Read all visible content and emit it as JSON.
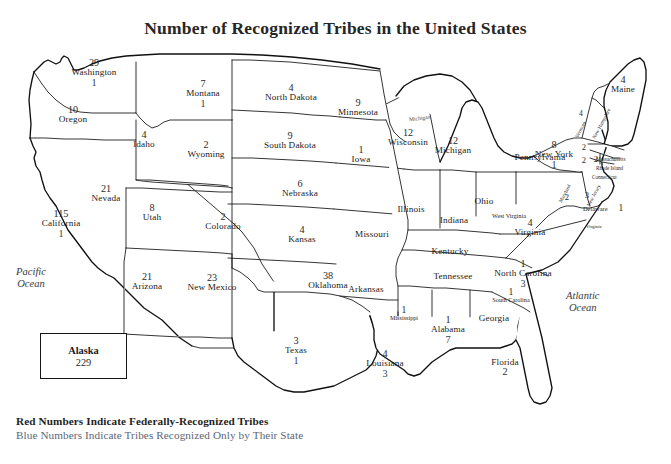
{
  "title": "Number of Recognized Tribes in the United States",
  "legend": {
    "federal": "Red Numbers Indicate Federally-Recognized Tribes",
    "state": "Blue Numbers Indicate Tribes Recognized Only by Their State"
  },
  "inset": {
    "name": "Alaska",
    "federal": "229"
  },
  "oceans": [
    {
      "name": "pacific",
      "line1": "Pacific",
      "line2": "Ocean"
    },
    {
      "name": "atlantic",
      "line1": "Atlantic",
      "line2": "Ocean"
    }
  ],
  "lakes": [
    {
      "name": "lake-michigan",
      "label": "Michigan"
    }
  ],
  "states": [
    {
      "key": "washington",
      "name": "Washington",
      "federal": "29",
      "state_only": "1"
    },
    {
      "key": "oregon",
      "name": "Oregon",
      "federal": "10",
      "state_only": ""
    },
    {
      "key": "idaho",
      "name": "Idaho",
      "federal": "4",
      "state_only": ""
    },
    {
      "key": "montana",
      "name": "Montana",
      "federal": "7",
      "state_only": "1"
    },
    {
      "key": "wyoming",
      "name": "Wyoming",
      "federal": "2",
      "state_only": ""
    },
    {
      "key": "nevada",
      "name": "Nevada",
      "federal": "21",
      "state_only": ""
    },
    {
      "key": "california",
      "name": "California",
      "federal": "115",
      "state_only": "1"
    },
    {
      "key": "utah",
      "name": "Utah",
      "federal": "8",
      "state_only": ""
    },
    {
      "key": "arizona",
      "name": "Arizona",
      "federal": "21",
      "state_only": ""
    },
    {
      "key": "colorado",
      "name": "Colorado",
      "federal": "2",
      "state_only": ""
    },
    {
      "key": "new-mexico",
      "name": "New Mexico",
      "federal": "23",
      "state_only": ""
    },
    {
      "key": "north-dakota",
      "name": "North Dakota",
      "federal": "4",
      "state_only": ""
    },
    {
      "key": "south-dakota",
      "name": "South Dakota",
      "federal": "9",
      "state_only": ""
    },
    {
      "key": "nebraska",
      "name": "Nebraska",
      "federal": "6",
      "state_only": ""
    },
    {
      "key": "kansas",
      "name": "Kansas",
      "federal": "4",
      "state_only": ""
    },
    {
      "key": "oklahoma",
      "name": "Oklahoma",
      "federal": "38",
      "state_only": ""
    },
    {
      "key": "texas",
      "name": "Texas",
      "federal": "3",
      "state_only": "1"
    },
    {
      "key": "minnesota",
      "name": "Minnesota",
      "federal": "9",
      "state_only": ""
    },
    {
      "key": "iowa",
      "name": "Iowa",
      "federal": "1",
      "state_only": ""
    },
    {
      "key": "missouri",
      "name": "Missouri",
      "federal": "",
      "state_only": ""
    },
    {
      "key": "arkansas",
      "name": "Arkansas",
      "federal": "",
      "state_only": ""
    },
    {
      "key": "louisiana",
      "name": "Louisiana",
      "federal": "4",
      "state_only": "3"
    },
    {
      "key": "wisconsin",
      "name": "Wisconsin",
      "federal": "12",
      "state_only": ""
    },
    {
      "key": "illinois",
      "name": "Illinois",
      "federal": "",
      "state_only": ""
    },
    {
      "key": "michigan",
      "name": "Michigan",
      "federal": "12",
      "state_only": ""
    },
    {
      "key": "indiana",
      "name": "Indiana",
      "federal": "",
      "state_only": ""
    },
    {
      "key": "ohio",
      "name": "Ohio",
      "federal": "",
      "state_only": ""
    },
    {
      "key": "kentucky",
      "name": "Kentucky",
      "federal": "",
      "state_only": ""
    },
    {
      "key": "tennessee",
      "name": "Tennessee",
      "federal": "",
      "state_only": ""
    },
    {
      "key": "mississippi",
      "name": "Mississippi",
      "federal": "1",
      "state_only": ""
    },
    {
      "key": "alabama",
      "name": "Alabama",
      "federal": "1",
      "state_only": "7"
    },
    {
      "key": "georgia",
      "name": "Georgia",
      "federal": "",
      "state_only": ""
    },
    {
      "key": "florida",
      "name": "Florida",
      "federal": "2",
      "state_only": ""
    },
    {
      "key": "south-carolina",
      "name": "South Carolina",
      "federal": "1",
      "state_only": ""
    },
    {
      "key": "north-carolina",
      "name": "North Carolina",
      "federal": "1",
      "state_only": "3"
    },
    {
      "key": "virginia",
      "name": "Virginia",
      "federal": "4",
      "state_only": ""
    },
    {
      "key": "west-virginia",
      "name": "West Virginia",
      "federal": "",
      "state_only": ""
    },
    {
      "key": "pennsylvania",
      "name": "Pennsylvania",
      "federal": "",
      "state_only": ""
    },
    {
      "key": "new-york",
      "name": "New York",
      "federal": "8",
      "state_only": "1"
    },
    {
      "key": "maine",
      "name": "Maine",
      "federal": "4",
      "state_only": ""
    },
    {
      "key": "vermont",
      "name": "Vermont",
      "federal": "4",
      "state_only": ""
    },
    {
      "key": "new-hampshire",
      "name": "New Hampshire",
      "federal": "",
      "state_only": ""
    },
    {
      "key": "massachusetts",
      "name": "Massachusetts",
      "federal": "2",
      "state_only": ""
    },
    {
      "key": "rhode-island",
      "name": "Rhode Island",
      "federal": "2",
      "state_only": ""
    },
    {
      "key": "connecticut",
      "name": "Connecticut",
      "federal": "2",
      "state_only": ""
    },
    {
      "key": "new-jersey",
      "name": "New Jersey",
      "federal": "3",
      "state_only": ""
    },
    {
      "key": "delaware",
      "name": "Delaware",
      "federal": "1",
      "state_only": ""
    },
    {
      "key": "maryland",
      "name": "Maryland",
      "federal": "2",
      "state_only": ""
    },
    {
      "key": "virginia-coast",
      "name": "Virginia",
      "federal": "",
      "state_only": ""
    }
  ]
}
